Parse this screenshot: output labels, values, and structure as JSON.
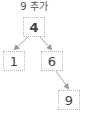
{
  "diagram": {
    "title": "9 추가",
    "nodes": [
      {
        "id": "n4",
        "label": "4",
        "x": 23,
        "y": 17
      },
      {
        "id": "n1",
        "label": "1",
        "x": 3,
        "y": 51
      },
      {
        "id": "n6",
        "label": "6",
        "x": 41,
        "y": 51
      },
      {
        "id": "n9",
        "label": "9",
        "x": 58,
        "y": 90
      }
    ],
    "edges": [
      {
        "from": "4",
        "to": "1"
      },
      {
        "from": "4",
        "to": "6"
      },
      {
        "from": "6",
        "to": "9"
      }
    ],
    "colors": {
      "edge": "#a0a0a0",
      "border": "#b8b8b8",
      "text": "#444444"
    }
  }
}
